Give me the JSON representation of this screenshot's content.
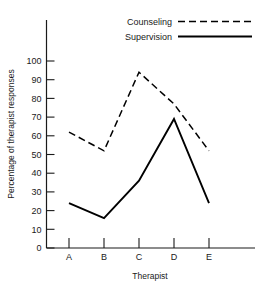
{
  "chart_data": {
    "type": "line",
    "title": "",
    "xlabel": "Therapist",
    "ylabel": "Percentage of therapist responses",
    "categories": [
      "A",
      "B",
      "C",
      "D",
      "E"
    ],
    "ylim": [
      0,
      100
    ],
    "yticks": [
      0,
      10,
      20,
      30,
      40,
      50,
      60,
      70,
      80,
      90,
      100
    ],
    "ytick_labels": [
      "0",
      "10",
      "20",
      "30",
      "40",
      "50",
      "60",
      "70",
      "80",
      "90",
      "100"
    ],
    "grid": false,
    "legend_position": "top-right",
    "series": [
      {
        "name": "Counseling",
        "style": "dashed",
        "color": "#000000",
        "values": [
          62,
          52,
          94,
          77,
          52
        ]
      },
      {
        "name": "Supervision",
        "style": "solid",
        "color": "#000000",
        "values": [
          24,
          16,
          36,
          69,
          24
        ]
      }
    ]
  },
  "legend": {
    "entries": [
      {
        "label": "Counseling",
        "swatch": "dashed-line-swatch"
      },
      {
        "label": "Supervision",
        "swatch": "solid-line-swatch"
      }
    ]
  },
  "axes": {
    "x_title": "Therapist",
    "y_title": "Percentage of therapist responses"
  }
}
